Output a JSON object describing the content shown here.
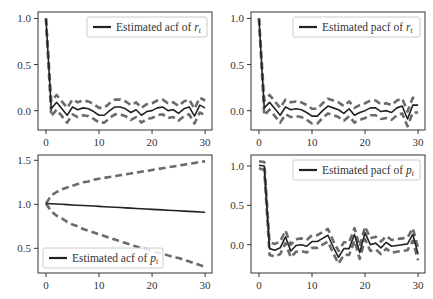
{
  "figure": {
    "width": 433,
    "height": 299,
    "background": "#ffffff"
  },
  "colors": {
    "main_line": "#222222",
    "band_line": "#6b6b6b",
    "axis": "#333333",
    "legend_border": "#cccccc"
  },
  "chart_data": [
    {
      "id": "acf_r",
      "type": "line",
      "legend": "Estimated acf of r_t",
      "legend_label": "Estimated acf of ",
      "legend_var": "r",
      "legend_sub": "t",
      "legend_pos": "upper right",
      "box": {
        "left": 38,
        "top": 12,
        "right": 212,
        "bottom": 130
      },
      "xlim": [
        -1.5,
        31.3
      ],
      "ylim": [
        -0.21,
        1.07
      ],
      "xticks": [
        0,
        10,
        20,
        30
      ],
      "yticks": [
        0.0,
        0.5,
        1.0
      ],
      "ytick_labels": [
        "0.0",
        "0.5",
        "1.0"
      ],
      "x": [
        0,
        1,
        2,
        3,
        4,
        5,
        6,
        7,
        8,
        9,
        10,
        11,
        12,
        13,
        14,
        15,
        16,
        17,
        18,
        19,
        20,
        21,
        22,
        23,
        24,
        25,
        26,
        27,
        28,
        29,
        30
      ],
      "series": [
        {
          "name": "estimate",
          "style": "solid",
          "values": [
            1.0,
            0.02,
            0.09,
            0.02,
            -0.05,
            0.04,
            0.01,
            0.03,
            0.02,
            -0.01,
            -0.05,
            -0.05,
            0.0,
            0.04,
            0.04,
            0.02,
            -0.02,
            0.01,
            -0.05,
            -0.01,
            0.0,
            0.03,
            0.04,
            0.0,
            0.01,
            -0.03,
            0.02,
            0.04,
            -0.06,
            0.06,
            0.03
          ]
        },
        {
          "name": "upper_band",
          "style": "dashed",
          "values": [
            1.0,
            0.1,
            0.17,
            0.1,
            0.03,
            0.12,
            0.09,
            0.11,
            0.1,
            0.07,
            0.03,
            0.03,
            0.08,
            0.12,
            0.12,
            0.1,
            0.06,
            0.09,
            0.03,
            0.07,
            0.08,
            0.11,
            0.12,
            0.08,
            0.09,
            0.05,
            0.1,
            0.12,
            0.02,
            0.14,
            0.11
          ]
        },
        {
          "name": "lower_band",
          "style": "dashed",
          "values": [
            1.0,
            -0.06,
            0.01,
            -0.06,
            -0.13,
            -0.04,
            -0.07,
            -0.05,
            -0.06,
            -0.09,
            -0.13,
            -0.13,
            -0.08,
            -0.04,
            -0.04,
            -0.06,
            -0.1,
            -0.07,
            -0.13,
            -0.09,
            -0.08,
            -0.05,
            -0.04,
            -0.08,
            -0.07,
            -0.11,
            -0.06,
            -0.04,
            -0.14,
            -0.02,
            -0.05
          ]
        }
      ]
    },
    {
      "id": "pacf_r",
      "type": "line",
      "legend": "Estimated pacf of r_t",
      "legend_label": "Estimated pacf of ",
      "legend_var": "r",
      "legend_sub": "t",
      "legend_pos": "upper right",
      "box": {
        "left": 251,
        "top": 12,
        "right": 425,
        "bottom": 130
      },
      "xlim": [
        -1.5,
        31.3
      ],
      "ylim": [
        -0.21,
        1.07
      ],
      "xticks": [
        0,
        10,
        20,
        30
      ],
      "yticks": [
        0.0,
        0.5,
        1.0
      ],
      "ytick_labels": [
        "0.0",
        "0.5",
        "1.0"
      ],
      "x": [
        0,
        1,
        2,
        3,
        4,
        5,
        6,
        7,
        8,
        9,
        10,
        11,
        12,
        13,
        14,
        15,
        16,
        17,
        18,
        19,
        20,
        21,
        22,
        23,
        24,
        25,
        26,
        27,
        28,
        29,
        30
      ],
      "series": [
        {
          "name": "estimate",
          "style": "solid",
          "values": [
            1.0,
            0.03,
            0.09,
            0.02,
            -0.05,
            0.04,
            0.01,
            0.02,
            0.01,
            -0.02,
            -0.06,
            -0.06,
            0.0,
            0.05,
            0.03,
            0.01,
            -0.03,
            0.02,
            -0.05,
            -0.02,
            0.0,
            0.03,
            0.03,
            -0.01,
            0.0,
            -0.02,
            0.03,
            0.05,
            -0.09,
            0.06,
            0.06
          ]
        },
        {
          "name": "upper_band",
          "style": "dashed",
          "values": [
            1.0,
            0.11,
            0.17,
            0.1,
            0.03,
            0.12,
            0.09,
            0.1,
            0.09,
            0.06,
            0.02,
            0.02,
            0.08,
            0.13,
            0.11,
            0.09,
            0.05,
            0.1,
            0.03,
            0.06,
            0.08,
            0.11,
            0.11,
            0.07,
            0.08,
            0.06,
            0.11,
            0.13,
            -0.01,
            0.14,
            0.14
          ]
        },
        {
          "name": "lower_band",
          "style": "dashed",
          "values": [
            1.0,
            -0.05,
            0.01,
            -0.06,
            -0.13,
            -0.04,
            -0.07,
            -0.06,
            -0.07,
            -0.1,
            -0.14,
            -0.14,
            -0.08,
            -0.03,
            -0.05,
            -0.07,
            -0.11,
            -0.06,
            -0.13,
            -0.1,
            -0.08,
            -0.05,
            -0.05,
            -0.09,
            -0.08,
            -0.1,
            -0.05,
            -0.03,
            -0.17,
            -0.02,
            -0.02
          ]
        }
      ]
    },
    {
      "id": "acf_p",
      "type": "line",
      "legend": "Estimated acf of p_t",
      "legend_label": "Estimated acf of ",
      "legend_var": "p",
      "legend_sub": "t",
      "legend_pos": "lower left",
      "box": {
        "left": 38,
        "top": 155,
        "right": 212,
        "bottom": 273
      },
      "xlim": [
        -1.5,
        31.3
      ],
      "ylim": [
        0.22,
        1.56
      ],
      "xticks": [
        0,
        10,
        20,
        30
      ],
      "yticks": [
        0.5,
        1.0,
        1.5
      ],
      "ytick_labels": [
        "0.5",
        "1.0",
        "1.5"
      ],
      "x": [
        0,
        1,
        2,
        3,
        4,
        5,
        6,
        7,
        8,
        9,
        10,
        11,
        12,
        13,
        14,
        15,
        16,
        17,
        18,
        19,
        20,
        21,
        22,
        23,
        24,
        25,
        26,
        27,
        28,
        29,
        30
      ],
      "series": [
        {
          "name": "estimate",
          "style": "solid",
          "values": [
            1.01,
            1.007,
            1.003,
            1.0,
            0.997,
            0.993,
            0.99,
            0.987,
            0.983,
            0.98,
            0.977,
            0.973,
            0.97,
            0.967,
            0.963,
            0.96,
            0.957,
            0.953,
            0.95,
            0.947,
            0.943,
            0.94,
            0.937,
            0.933,
            0.93,
            0.927,
            0.923,
            0.92,
            0.917,
            0.913,
            0.91
          ]
        },
        {
          "name": "upper_band",
          "style": "dashed",
          "values": [
            1.01,
            1.1,
            1.14,
            1.17,
            1.19,
            1.21,
            1.23,
            1.25,
            1.26,
            1.28,
            1.29,
            1.3,
            1.31,
            1.32,
            1.33,
            1.34,
            1.35,
            1.36,
            1.37,
            1.38,
            1.39,
            1.4,
            1.41,
            1.42,
            1.43,
            1.44,
            1.45,
            1.46,
            1.47,
            1.48,
            1.49
          ]
        },
        {
          "name": "lower_band",
          "style": "dashed",
          "values": [
            1.01,
            0.92,
            0.87,
            0.84,
            0.8,
            0.77,
            0.75,
            0.72,
            0.7,
            0.68,
            0.66,
            0.64,
            0.62,
            0.6,
            0.58,
            0.56,
            0.54,
            0.52,
            0.5,
            0.49,
            0.47,
            0.45,
            0.44,
            0.42,
            0.4,
            0.39,
            0.37,
            0.35,
            0.33,
            0.31,
            0.29
          ]
        }
      ]
    },
    {
      "id": "pacf_p",
      "type": "line",
      "legend": "Estimated pacf of p_t",
      "legend_label": "Estimated pacf of ",
      "legend_var": "p",
      "legend_sub": "t",
      "legend_pos": "upper right",
      "box": {
        "left": 251,
        "top": 155,
        "right": 425,
        "bottom": 273
      },
      "xlim": [
        -1.5,
        31.3
      ],
      "ylim": [
        -0.36,
        1.14
      ],
      "xticks": [
        0,
        10,
        20,
        30
      ],
      "yticks": [
        0.0,
        0.5,
        1.0
      ],
      "ytick_labels": [
        "0.0",
        "0.5",
        "1.0"
      ],
      "x": [
        0,
        1,
        2,
        3,
        4,
        5,
        6,
        7,
        8,
        9,
        10,
        11,
        12,
        13,
        14,
        15,
        16,
        17,
        18,
        19,
        20,
        21,
        22,
        23,
        24,
        25,
        26,
        27,
        28,
        29,
        30
      ],
      "series": [
        {
          "name": "estimate",
          "style": "solid",
          "values": [
            1.01,
            1.0,
            -0.05,
            -0.07,
            -0.04,
            0.1,
            -0.08,
            -0.01,
            0.0,
            -0.02,
            0.04,
            0.04,
            0.08,
            0.12,
            -0.03,
            -0.16,
            -0.05,
            -0.05,
            0.13,
            -0.1,
            0.15,
            0.0,
            0.02,
            -0.04,
            0.03,
            -0.02,
            -0.01,
            0.0,
            0.01,
            0.13,
            -0.12
          ]
        },
        {
          "name": "upper_band",
          "style": "dashed",
          "values": [
            1.06,
            1.05,
            0.03,
            0.01,
            0.04,
            0.18,
            0.0,
            0.07,
            0.08,
            0.06,
            0.12,
            0.12,
            0.16,
            0.2,
            0.05,
            -0.08,
            0.03,
            0.03,
            0.21,
            -0.02,
            0.23,
            0.08,
            0.1,
            0.04,
            0.11,
            0.06,
            0.07,
            0.08,
            0.09,
            0.21,
            -0.04
          ]
        },
        {
          "name": "lower_band",
          "style": "dashed",
          "values": [
            0.97,
            0.95,
            -0.13,
            -0.15,
            -0.12,
            0.02,
            -0.16,
            -0.09,
            -0.08,
            -0.1,
            -0.04,
            -0.04,
            0.0,
            0.04,
            -0.11,
            -0.24,
            -0.13,
            -0.13,
            0.05,
            -0.18,
            0.07,
            -0.08,
            -0.06,
            -0.12,
            -0.05,
            -0.1,
            -0.09,
            -0.08,
            -0.07,
            0.05,
            -0.2
          ]
        }
      ]
    }
  ]
}
